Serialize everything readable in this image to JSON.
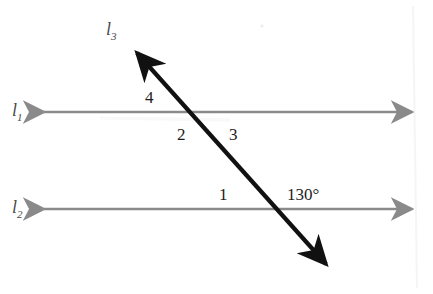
{
  "figure": {
    "background_color": "#ffffff",
    "parallel_line_color": "#8a8a8a",
    "transversal_color": "#111111",
    "label_color": "#1c1c1c"
  },
  "lines": [
    {
      "id": "l1",
      "label": "l",
      "subscript": "1",
      "kind": "parallel-line",
      "y": 112,
      "x_start": 36,
      "x_end": 420,
      "arrows": "both",
      "color": "#8a8a8a"
    },
    {
      "id": "l2",
      "label": "l",
      "subscript": "2",
      "kind": "parallel-line",
      "y": 209,
      "x_start": 36,
      "x_end": 420,
      "arrows": "both",
      "color": "#8a8a8a"
    },
    {
      "id": "l3",
      "label": "l",
      "subscript": "3",
      "kind": "transversal",
      "x_start": 130,
      "y_start": 45,
      "x_end": 333,
      "y_end": 272,
      "arrows": "both",
      "color": "#111111"
    }
  ],
  "intersections": [
    {
      "line": "l1",
      "x": 196,
      "y": 112
    },
    {
      "line": "l2",
      "x": 276,
      "y": 209
    }
  ],
  "angle_labels": [
    {
      "id": "angle-4",
      "text": "4",
      "x": 148,
      "y": 97
    },
    {
      "id": "angle-2",
      "text": "2",
      "x": 181,
      "y": 134
    },
    {
      "id": "angle-3",
      "text": "3",
      "x": 233,
      "y": 134
    },
    {
      "id": "angle-1",
      "text": "1",
      "x": 222,
      "y": 194
    }
  ],
  "angle_measures": [
    {
      "id": "angle-130",
      "text": "130°",
      "x": 290,
      "y": 194
    }
  ],
  "line_labels": [
    {
      "id": "label-l1",
      "text": "l",
      "sub": "1",
      "x": 12,
      "y": 104
    },
    {
      "id": "label-l2",
      "text": "l",
      "sub": "2",
      "x": 12,
      "y": 201
    },
    {
      "id": "label-l3",
      "text": "l",
      "sub": "3",
      "x": 106,
      "y": 23
    }
  ]
}
